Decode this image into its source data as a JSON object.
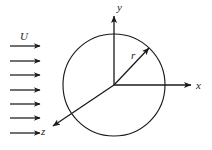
{
  "figure": {
    "background_color": "#ffffff",
    "stroke_color": "#1a1a1a",
    "width": 212,
    "height": 150
  },
  "flow": {
    "label": "U",
    "label_x": 24,
    "label_y": 40,
    "arrow_count": 7,
    "arrow_x_start": 10,
    "arrow_x_end": 40,
    "arrow_rows_y": [
      46,
      61,
      75,
      90,
      104,
      118,
      133
    ]
  },
  "cylinder": {
    "name": "cylinder-circle",
    "center_x": 114,
    "center_y": 85,
    "radius": 51
  },
  "axes": [
    {
      "label": "y",
      "name": "y-axis",
      "from_x": 114,
      "from_y": 85,
      "to_x": 114,
      "to_y": 16,
      "label_x": 117,
      "label_y": 11
    },
    {
      "label": "x",
      "name": "x-axis",
      "from_x": 114,
      "from_y": 85,
      "to_x": 191,
      "to_y": 85,
      "label_x": 196,
      "label_y": 89
    },
    {
      "label": "z",
      "name": "z-axis",
      "from_x": 114,
      "from_y": 85,
      "to_x": 53,
      "to_y": 126,
      "label_x": 41,
      "label_y": 135
    }
  ],
  "radius_vector": {
    "label": "r",
    "name": "radius-vector",
    "from_x": 114,
    "from_y": 85,
    "to_x": 149,
    "to_y": 48,
    "label_x": 131,
    "label_y": 59
  }
}
